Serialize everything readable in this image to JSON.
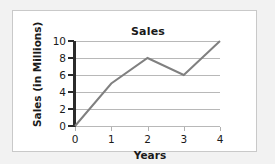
{
  "chart_data": {
    "type": "line",
    "title": "Sales",
    "xlabel": "Years",
    "ylabel": "Sales (in Millions)",
    "x": [
      0,
      1,
      2,
      3,
      4
    ],
    "values": [
      0,
      5,
      8,
      6,
      10
    ],
    "series": [
      {
        "name": "Sales",
        "values": [
          0,
          5,
          8,
          6,
          10
        ],
        "color": "#808080"
      }
    ],
    "xlim": [
      0,
      4
    ],
    "ylim": [
      0,
      10
    ],
    "xticks": [
      "0",
      "1",
      "2",
      "3",
      "4"
    ],
    "yticks": [
      "0",
      "2",
      "4",
      "6",
      "8",
      "10"
    ],
    "xtick_values": [
      0,
      1,
      2,
      3,
      4
    ],
    "ytick_values": [
      0,
      2,
      4,
      6,
      8,
      10
    ],
    "grid": "horizontal",
    "legend": "none",
    "line_color": "#808080",
    "line_width": 2,
    "gridline_color": "#b8b8b8",
    "axis_color": "#2b2b2b",
    "background_color": "#ffffff",
    "border_color": "#c9c9c9"
  }
}
